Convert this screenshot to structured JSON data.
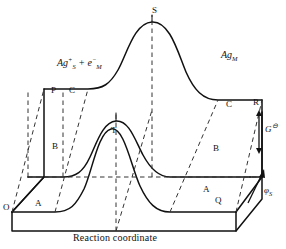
{
  "figure": {
    "type": "3d-potential-energy-surface-diagram",
    "caption": "Reaction coordinate",
    "species_left": {
      "element": "Ag",
      "charge": "+",
      "phase_sub": "S",
      "plus": "+",
      "electron": "e",
      "electron_charge": "−",
      "electron_sub": "M",
      "full": "Ag⁺ₛ + e⁻ₘ"
    },
    "species_right": {
      "element": "Ag",
      "phase_sub": "M",
      "full": "Agₘ"
    },
    "axes": {
      "vertical": {
        "symbol": "G",
        "superscript": "⊖",
        "full": "G⊖"
      },
      "depth": {
        "symbol": "φ",
        "subscript": "S",
        "full": "φₛ"
      },
      "horizontal": {
        "label": "Reaction coordinate"
      }
    },
    "point_labels": [
      {
        "id": "S",
        "text": "S",
        "x": 152,
        "y": 6
      },
      {
        "id": "P",
        "text": "P",
        "x": 51,
        "y": 86
      },
      {
        "id": "C1",
        "text": "C",
        "x": 69,
        "y": 86
      },
      {
        "id": "C2",
        "text": "C",
        "x": 226,
        "y": 100
      },
      {
        "id": "R",
        "text": "R",
        "x": 253,
        "y": 98
      },
      {
        "id": "T",
        "text": "T",
        "x": 111,
        "y": 126
      },
      {
        "id": "B1",
        "text": "B",
        "x": 52,
        "y": 142
      },
      {
        "id": "B2",
        "text": "B",
        "x": 213,
        "y": 144
      },
      {
        "id": "A1",
        "text": "A",
        "x": 35,
        "y": 199
      },
      {
        "id": "A2",
        "text": "A",
        "x": 203,
        "y": 185
      },
      {
        "id": "O",
        "text": "O",
        "x": 3,
        "y": 203
      },
      {
        "id": "Q",
        "text": "Q",
        "x": 215,
        "y": 196
      }
    ],
    "colors": {
      "stroke": "#111111",
      "background": "#ffffff",
      "dashed": "#333333"
    }
  }
}
